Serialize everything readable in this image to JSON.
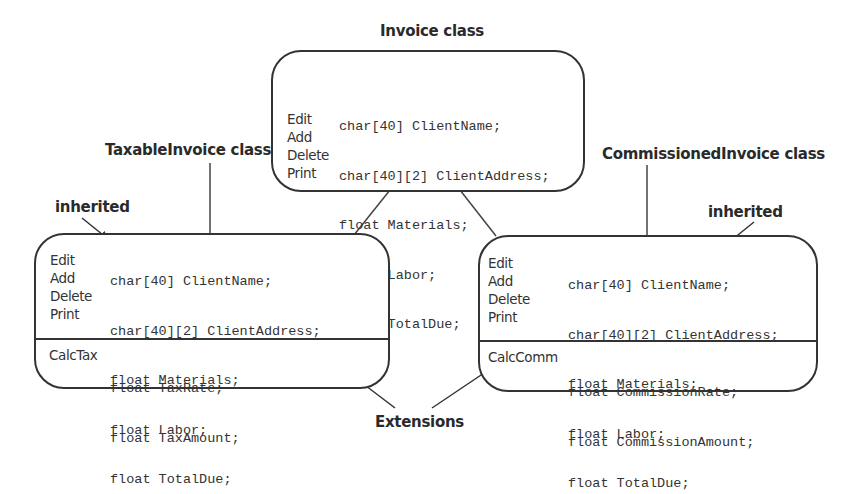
{
  "diagram": {
    "base_class": {
      "title": "Invoice class",
      "methods": [
        "Edit",
        "Add",
        "Delete",
        "Print"
      ],
      "fields": [
        "char[40] ClientName;",
        "char[40][2] ClientAddress;",
        "float Materials;",
        "float Labor;",
        "float TotalDue;"
      ]
    },
    "taxable_class": {
      "title": "TaxableInvoice class",
      "inherited_label": "inherited",
      "methods": [
        "Edit",
        "Add",
        "Delete",
        "Print"
      ],
      "fields": [
        "char[40] ClientName;",
        "char[40][2] ClientAddress;",
        "float Materials;",
        "float Labor;",
        "float TotalDue;"
      ],
      "extension_method": "CalcTax",
      "extension_fields": [
        "float TaxRate;",
        "float TaxAmount;"
      ]
    },
    "commissioned_class": {
      "title": "CommissionedInvoice class",
      "inherited_label": "inherited",
      "methods": [
        "Edit",
        "Add",
        "Delete",
        "Print"
      ],
      "fields": [
        "char[40] ClientName;",
        "char[40][2] ClientAddress;",
        "float Materials;",
        "float Labor;",
        "float TotalDue;"
      ],
      "extension_method": "CalcComm",
      "extension_fields": [
        "float CommissionRate;",
        "float CommissionAmount;"
      ]
    },
    "extensions_label": "Extensions"
  }
}
